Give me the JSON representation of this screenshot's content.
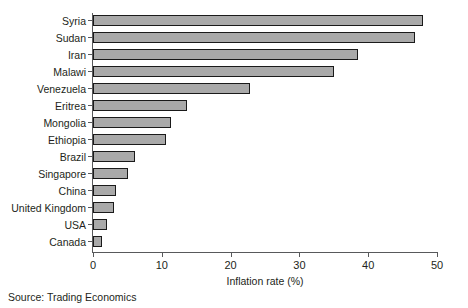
{
  "chart_data": {
    "type": "bar",
    "orientation": "horizontal",
    "title": "",
    "xlabel": "Inflation rate (%)",
    "ylabel": "",
    "xlim": [
      0,
      50
    ],
    "xticks": [
      0,
      10,
      20,
      30,
      40,
      50
    ],
    "xticklabels": [
      "0",
      "10",
      "20",
      "30",
      "40",
      "50"
    ],
    "grid": false,
    "legend": null,
    "categories": [
      "Syria",
      "Sudan",
      "Iran",
      "Malawi",
      "Venezuela",
      "Eritrea",
      "Mongolia",
      "Ethiopia",
      "Brazil",
      "Singapore",
      "China",
      "United Kingdom",
      "USA",
      "Canada"
    ],
    "values": [
      48.0,
      46.8,
      38.5,
      35.0,
      22.8,
      13.6,
      11.3,
      10.6,
      6.1,
      5.1,
      3.4,
      3.1,
      2.1,
      1.3
    ],
    "bar_fill_color": "#a9a9a9",
    "bar_edge_color": "#1a1a1a",
    "axis_color": "#58595b"
  },
  "footer": {
    "source": "Source: Trading Economics"
  }
}
